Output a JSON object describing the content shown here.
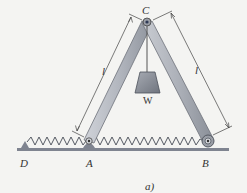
{
  "figure": {
    "caption": "a)",
    "labels": {
      "C": "C",
      "A": "A",
      "B": "B",
      "D": "D",
      "W": "W",
      "l_left": "l",
      "l_right": "l"
    },
    "colors": {
      "background": "#f4f4f2",
      "bar_fill": "#b8bcc4",
      "bar_edge": "#6d717a",
      "ground": "#7f8490",
      "spring": "#555a63",
      "weight_fill": "#8d929c",
      "text": "#333333"
    }
  }
}
